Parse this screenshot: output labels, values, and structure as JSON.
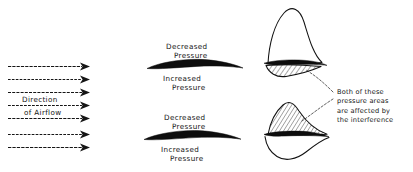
{
  "figure": {
    "background_color": "#ffffff",
    "ink_color": "#141414"
  },
  "airflow_panel": {
    "label_line1": "Direction",
    "label_line2": "of  Airflow",
    "arrow_count": 7,
    "arrow_direction": "right",
    "arrow_rows_y": [
      66,
      79,
      92,
      105,
      118,
      134,
      147
    ],
    "arrow_x_start": 8,
    "arrow_x_end": 88
  },
  "airfoil_panels": [
    {
      "id": "upper-airfoil",
      "label_above_line1": "Decreased",
      "label_above_line2": "Pressure",
      "label_below_line1": "Increased",
      "label_below_line2": "Pressure"
    },
    {
      "id": "lower-airfoil",
      "label_above_line1": "Decreased",
      "label_above_line2": "Pressure",
      "label_below_line1": "Increased",
      "label_below_line2": "Pressure"
    }
  ],
  "pressure_panels": [
    {
      "id": "upper-pressure-distribution",
      "upper_lobe_style": "outline",
      "lower_lobe_style": "hatched"
    },
    {
      "id": "lower-pressure-distribution",
      "upper_lobe_style": "hatched",
      "lower_lobe_style": "outline"
    }
  ],
  "annotation": {
    "line1": "Both of these",
    "line2": "pressure areas",
    "line3": "are affected by",
    "line4": "the interference",
    "leader_count": 2
  }
}
